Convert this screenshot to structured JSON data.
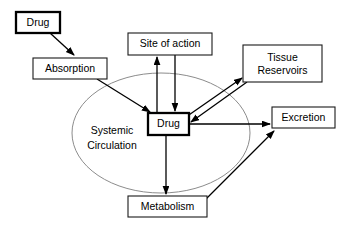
{
  "diagram": {
    "background_color": "#ffffff",
    "stroke_color": "#000000",
    "ellipse_stroke_color": "#8c8c8c",
    "nodes": {
      "drug_source": {
        "label": "Drug",
        "emphasis": "thick"
      },
      "absorption": {
        "label": "Absorption",
        "emphasis": "thin"
      },
      "site_of_action": {
        "label": "Site of action",
        "emphasis": "thin"
      },
      "tissue_reservoirs": {
        "label_line1": "Tissue",
        "label_line2": "Reservoirs",
        "emphasis": "thin"
      },
      "drug_central": {
        "label": "Drug",
        "emphasis": "thick"
      },
      "excretion": {
        "label": "Excretion",
        "emphasis": "thin"
      },
      "metabolism": {
        "label": "Metabolism",
        "emphasis": "thin"
      },
      "systemic_circulation": {
        "label_line1": "Systemic",
        "label_line2": "Circulation"
      }
    },
    "edges": [
      {
        "from": "drug_source",
        "to": "absorption",
        "direction": "one-way"
      },
      {
        "from": "absorption",
        "to": "drug_central",
        "direction": "one-way"
      },
      {
        "from": "drug_central",
        "to": "site_of_action",
        "direction": "one-way"
      },
      {
        "from": "site_of_action",
        "to": "drug_central",
        "direction": "one-way"
      },
      {
        "from": "drug_central",
        "to": "tissue_reservoirs",
        "direction": "one-way"
      },
      {
        "from": "tissue_reservoirs",
        "to": "drug_central",
        "direction": "one-way"
      },
      {
        "from": "drug_central",
        "to": "excretion",
        "direction": "one-way"
      },
      {
        "from": "drug_central",
        "to": "metabolism",
        "direction": "one-way"
      },
      {
        "from": "metabolism",
        "to": "excretion",
        "direction": "one-way"
      }
    ]
  }
}
